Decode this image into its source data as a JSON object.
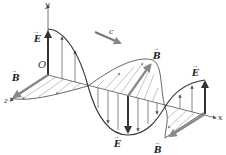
{
  "diagram": {
    "axes": {
      "x_label": "x",
      "y_label": "y",
      "z_label": "z",
      "origin_label": "O"
    },
    "wave_velocity_label": "c",
    "field_labels": {
      "E_origin": "E",
      "B_origin": "B",
      "B_mid": "B",
      "E_mid": "E",
      "E_right": "E",
      "B_right": "B"
    },
    "vector_mark": "→",
    "colors": {
      "axis": "#555555",
      "e_curve": "#333333",
      "b_curve": "#666666",
      "e_vectors": "#444444",
      "b_vectors": "#8a8a8a",
      "velocity_arrow": "#777777"
    }
  }
}
